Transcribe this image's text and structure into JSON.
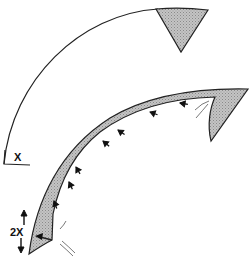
{
  "diagram": {
    "labels": {
      "x_label": "X",
      "two_x_label": "2X"
    },
    "colors": {
      "stroke": "#222222",
      "shade": "#b8b8b8",
      "background": "#ffffff"
    },
    "arrows": {
      "count_along_inner_curve": 7,
      "direction": "toward lower-left tip (inward along curve)"
    }
  }
}
